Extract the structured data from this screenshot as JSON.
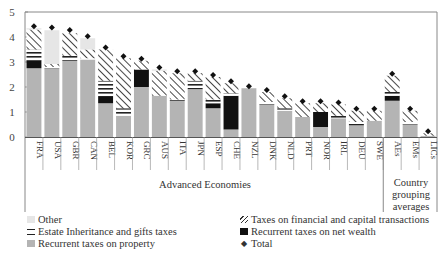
{
  "chart_data": {
    "type": "bar",
    "stacked": true,
    "title": "",
    "xlabel": "",
    "ylabel": "",
    "ylim": [
      0,
      5
    ],
    "yticks": [
      0,
      1,
      2,
      3,
      4,
      5
    ],
    "grid": false,
    "legend_position": "bottom",
    "categories": [
      "FRA",
      "USA",
      "GBR",
      "CAN",
      "BEL",
      "KOR",
      "GRC",
      "AUS",
      "ITA",
      "JPN",
      "ESP",
      "CHE",
      "NZL",
      "DNK",
      "NLD",
      "PRT",
      "NOR",
      "IRL",
      "DEU",
      "SWE",
      "AEs",
      "EMs",
      "LICs"
    ],
    "groups": [
      {
        "label": "Advanced Economies",
        "start": 0,
        "end": 19
      },
      {
        "label": "Country grouping averages",
        "start": 20,
        "end": 22
      }
    ],
    "series": [
      {
        "name": "Recurrent taxes on property",
        "key": "prop",
        "color": "#b4b4b4",
        "values": [
          2.75,
          2.75,
          3.05,
          3.1,
          1.35,
          0.85,
          2.0,
          1.65,
          1.45,
          1.9,
          1.15,
          0.3,
          1.95,
          1.3,
          1.05,
          0.8,
          0.4,
          0.75,
          0.45,
          0.65,
          1.45,
          0.5,
          0.05
        ]
      },
      {
        "name": "Recurrent taxes on net wealth",
        "key": "nw",
        "color": "#111111",
        "values": [
          0.3,
          0,
          0,
          0,
          0.25,
          0,
          0.7,
          0,
          0,
          0,
          0.2,
          1.35,
          0,
          0,
          0,
          0,
          0.6,
          0,
          0,
          0,
          0.2,
          0,
          0
        ]
      },
      {
        "name": "Estate Inheritance and gifts taxes",
        "key": "estate",
        "color": "striped-horizontal",
        "values": [
          0.45,
          0.05,
          0.2,
          0.05,
          0.65,
          0.3,
          0,
          0,
          0.05,
          0.35,
          0.15,
          0.1,
          0,
          0.1,
          0.1,
          0,
          0,
          0.1,
          0.15,
          0,
          0.15,
          0.1,
          0
        ]
      },
      {
        "name": "Taxes on financial and capital transactions",
        "key": "fin",
        "color": "hatched-diagonal",
        "values": [
          0.8,
          0.12,
          0.9,
          0.35,
          1.25,
          2.0,
          0.35,
          1.0,
          1.05,
          0.3,
          0.9,
          0.4,
          0,
          0.4,
          0.4,
          0.55,
          0.35,
          0.45,
          0.45,
          0.4,
          0.65,
          0.45,
          0.1
        ]
      },
      {
        "name": "Other",
        "key": "other",
        "color": "#e6e6e6",
        "values": [
          0.05,
          1.35,
          0,
          0.45,
          0,
          0,
          0,
          0.05,
          0,
          0,
          0,
          0,
          0,
          0,
          0,
          0,
          0,
          0,
          0,
          0,
          0,
          0,
          0
        ]
      }
    ],
    "total": {
      "name": "Total",
      "marker": "diamond",
      "values": [
        4.35,
        4.3,
        4.2,
        3.95,
        3.5,
        3.15,
        3.05,
        2.7,
        2.55,
        2.55,
        2.4,
        2.15,
        1.95,
        1.8,
        1.55,
        1.35,
        1.35,
        1.3,
        1.05,
        1.05,
        2.45,
        1.05,
        0.15
      ]
    }
  },
  "legend": {
    "left": [
      {
        "label": "Other",
        "swatch": "other"
      },
      {
        "label": "Estate Inheritance and gifts taxes",
        "swatch": "estate"
      },
      {
        "label": "Recurrent taxes on property",
        "swatch": "prop"
      }
    ],
    "right": [
      {
        "label": "Taxes on financial and capital transactions",
        "swatch": "fin"
      },
      {
        "label": "Recurrent taxes on net wealth",
        "swatch": "nw"
      },
      {
        "label": "Total",
        "swatch": "total",
        "glyph": "◆"
      }
    ]
  },
  "groups": {
    "advanced": "Advanced Economies",
    "averages_line1": "Country",
    "averages_line2": "grouping",
    "averages_line3": "averages"
  }
}
